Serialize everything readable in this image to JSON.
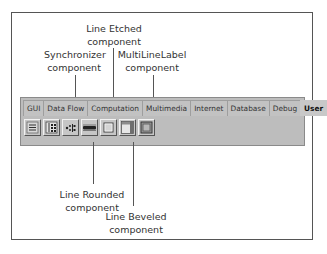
{
  "palette": {
    "tabs": [
      {
        "label": "GUI",
        "active": false
      },
      {
        "label": "Data Flow",
        "active": false
      },
      {
        "label": "Computation",
        "active": false
      },
      {
        "label": "Multimedia",
        "active": false
      },
      {
        "label": "Internet",
        "active": false
      },
      {
        "label": "Database",
        "active": false
      },
      {
        "label": "Debug",
        "active": false
      },
      {
        "label": "User",
        "active": true
      }
    ],
    "tools": [
      {
        "icon": "list-icon"
      },
      {
        "icon": "grid-list-icon"
      },
      {
        "icon": "synchronizer-icon"
      },
      {
        "icon": "line-rounded-icon"
      },
      {
        "icon": "line-etched-icon"
      },
      {
        "icon": "line-beveled-icon"
      },
      {
        "icon": "multilinelabel-icon"
      }
    ]
  },
  "callouts": {
    "line_etched": {
      "line1": "Line Etched",
      "line2": "component"
    },
    "synchronizer": {
      "line1": "Synchronizer",
      "line2": "component"
    },
    "multilinelabel": {
      "line1": "MultiLineLabel",
      "line2": "component"
    },
    "line_rounded": {
      "line1": "Line Rounded",
      "line2": "component"
    },
    "line_beveled": {
      "line1": "Line Beveled",
      "line2": "component"
    }
  }
}
